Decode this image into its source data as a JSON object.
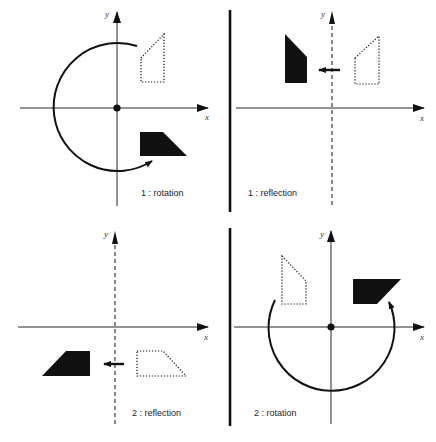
{
  "figure": {
    "colors": {
      "ink": "#111111",
      "background": "#ffffff"
    },
    "axis_labels": {
      "x": "x",
      "y": "y"
    },
    "panels": [
      {
        "id": "p1",
        "label": "1 : rotation",
        "transform": "rotation",
        "axis_style": "solid",
        "has_origin_dot": true
      },
      {
        "id": "p2",
        "label": "1 : reflection",
        "transform": "reflection",
        "axis_style": "dashed-y",
        "has_origin_dot": false
      },
      {
        "id": "p3",
        "label": "2 : reflection",
        "transform": "reflection",
        "axis_style": "dashed-y",
        "has_origin_dot": false
      },
      {
        "id": "p4",
        "label": "2 : rotation",
        "transform": "rotation",
        "axis_style": "solid",
        "has_origin_dot": true
      }
    ],
    "legend": {
      "original_shape": "dotted outline",
      "transformed_shape": "solid filled"
    }
  }
}
